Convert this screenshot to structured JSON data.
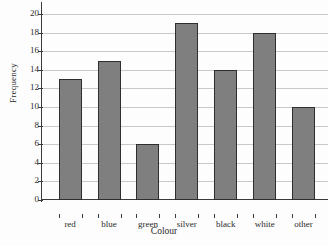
{
  "chart_data": {
    "type": "bar",
    "title": "",
    "xlabel": "Colour",
    "ylabel": "Frequency",
    "categories": [
      "red",
      "blue",
      "green",
      "silver",
      "black",
      "white",
      "other"
    ],
    "values": [
      13,
      15,
      6,
      19,
      14,
      18,
      10
    ],
    "ylim": [
      0,
      20
    ],
    "ytick_step": 2,
    "yticks": [
      0,
      2,
      4,
      6,
      8,
      10,
      12,
      14,
      16,
      18,
      20
    ],
    "ytick_labels": [
      "0",
      "2",
      "4",
      "6",
      "8",
      "10",
      "12",
      "14",
      "16",
      "18",
      "20"
    ],
    "grid": true,
    "grid_axis": "y",
    "legend": false,
    "legend_position": "none",
    "bar_color": "#7f7f7f",
    "bar_edge_color": "#2e2e2e",
    "grid_color": "#c9c9c9",
    "axis_color": "#3a3a3a",
    "background_color": "#fdfdfd",
    "series": [
      {
        "name": "Frequency",
        "values": [
          13,
          15,
          6,
          19,
          14,
          18,
          10
        ]
      }
    ]
  }
}
